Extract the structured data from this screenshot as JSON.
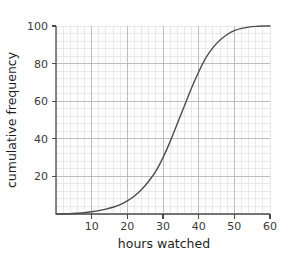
{
  "chart_data": {
    "type": "line",
    "title": "",
    "subtitle": "",
    "xlabel": "hours watched",
    "ylabel": "cumulative frequency",
    "xlim": [
      0,
      60
    ],
    "ylim": [
      0,
      100
    ],
    "xticks": [
      10,
      20,
      30,
      40,
      50,
      60
    ],
    "xtick_labels": [
      "10",
      "20",
      "30",
      "40",
      "50",
      "60"
    ],
    "yticks": [
      20,
      40,
      60,
      80,
      100
    ],
    "ytick_labels": [
      "20",
      "40",
      "60",
      "80",
      "100"
    ],
    "grid": true,
    "grid_major_x_step": 10,
    "grid_major_y_step": 20,
    "grid_minor_x_step": 2,
    "grid_minor_y_step": 4,
    "legend": null,
    "annotations": [],
    "series": [
      {
        "name": "cumulative frequency",
        "color": "#4d4d4d",
        "line_width": 1.4,
        "marker": "none",
        "x": [
          0,
          2,
          4,
          6,
          8,
          10,
          12,
          14,
          16,
          18,
          20,
          22,
          24,
          26,
          28,
          30,
          32,
          34,
          36,
          38,
          40,
          42,
          44,
          46,
          48,
          50,
          52,
          54,
          56,
          58,
          60
        ],
        "y": [
          0,
          0,
          0.2,
          0.4,
          0.7,
          1.2,
          1.8,
          2.6,
          3.6,
          5.0,
          7.0,
          9.6,
          13.0,
          17.4,
          22.8,
          30.0,
          38.5,
          48.0,
          57.5,
          67.0,
          75.5,
          83.0,
          88.5,
          92.5,
          95.5,
          97.5,
          98.7,
          99.4,
          99.8,
          100.0,
          100.0
        ]
      }
    ],
    "colors": {
      "curve": "#4d4d4d",
      "axis": "#4a4a4a",
      "grid_major": "#b9b9b9",
      "grid_minor": "#e0e0e0",
      "plot_background": "#fdfdfd",
      "figure_background": "#ffffff",
      "tick_text": "#3a3a3a",
      "title_text": "#1e1e1e"
    },
    "geometry": {
      "plot_left": 56,
      "plot_right": 270,
      "plot_top": 26,
      "plot_bottom": 214
    }
  }
}
